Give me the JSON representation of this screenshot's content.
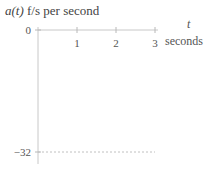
{
  "chart_data": {
    "type": "line",
    "title": "a(t) f/s per second",
    "title_italic_part": "a(t)",
    "title_rest": " f/s per second",
    "xlabel_var": "t",
    "xlabel_unit": "seconds",
    "ylabel": "",
    "xlim": [
      0,
      3
    ],
    "ylim": [
      -32,
      0
    ],
    "x_ticks": [
      1,
      2,
      3
    ],
    "x_tick_labels": [
      "1",
      "2",
      "3"
    ],
    "y_ticks": [
      0,
      -32
    ],
    "y_tick_labels": [
      "0",
      "−32"
    ],
    "grid": false,
    "legend": "none",
    "series": [
      {
        "name": "a(t)",
        "style": "dashed",
        "x": [
          0,
          3
        ],
        "y": [
          -32,
          -32
        ]
      }
    ]
  }
}
